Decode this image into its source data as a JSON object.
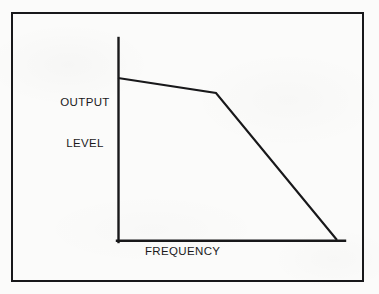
{
  "figure": {
    "background_color": "#fbfbfa",
    "ink_color": "#18181a",
    "border": {
      "name": "figure-frame",
      "width_px": 2,
      "color": "#18181a"
    }
  },
  "labels": {
    "y_axis_line1": "OUTPUT",
    "y_axis_line2": "LEVEL",
    "x_axis": "FREQUENCY"
  },
  "chart_data": {
    "type": "line",
    "title": "",
    "subtitle": "",
    "xlabel": "FREQUENCY",
    "ylabel": "OUTPUT LEVEL",
    "grid": false,
    "legend": null,
    "axes": {
      "x_axis_shown": true,
      "y_axis_shown": true,
      "x_tick_labels": [],
      "y_tick_labels": [],
      "xlim": [
        0,
        100
      ],
      "ylim": [
        0,
        100
      ]
    },
    "series": [
      {
        "name": "response",
        "color": "#18181a",
        "points": [
          {
            "x": 0.0,
            "y": 80.3,
            "note": "start at y-axis"
          },
          {
            "x": 43.2,
            "y": 72.9,
            "note": "knee / breakpoint"
          },
          {
            "x": 96.0,
            "y": 0.0,
            "note": "meets baseline"
          }
        ]
      }
    ]
  },
  "geometry": {
    "frame": {
      "x": 11,
      "y": 12,
      "w": 353,
      "h": 270
    },
    "y_axis": {
      "x": 118,
      "y_top": 38,
      "y_bottom": 242
    },
    "x_axis": {
      "y": 241,
      "x_left": 117,
      "x_right": 345
    },
    "curve_points": [
      {
        "x": 118,
        "y": 78
      },
      {
        "x": 216,
        "y": 93
      },
      {
        "x": 337,
        "y": 240
      }
    ]
  }
}
